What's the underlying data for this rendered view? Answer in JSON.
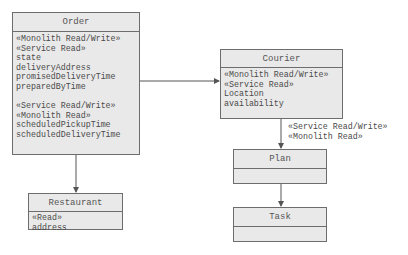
{
  "classes": {
    "order": {
      "name": "Order",
      "group1": [
        "«Monolith Read/Write»",
        "«Service Read»",
        "state",
        "deliveryAddress",
        "promisedDeliveryTime",
        "preparedByTime"
      ],
      "group2": [
        "«Service Read/Write»",
        "«Monolith Read»",
        "scheduledPickupTime",
        "scheduledDeliveryTime"
      ]
    },
    "courier": {
      "name": "Courier",
      "lines": [
        "«Monolith Read/Write»",
        "«Service Read»",
        "Location",
        "availability"
      ]
    },
    "restaurant": {
      "name": "Restaurant",
      "lines": [
        "«Read»",
        "address"
      ]
    },
    "plan": {
      "name": "Plan"
    },
    "task": {
      "name": "Task"
    }
  },
  "edges": {
    "courier_plan_label": [
      "«Service Read/Write»",
      "«Monolith Read»"
    ]
  }
}
